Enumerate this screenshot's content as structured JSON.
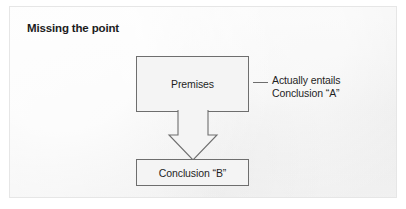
{
  "panel": {
    "background_color": "#f2f2f2",
    "border_color": "#e6e6e6"
  },
  "title": "Missing the point",
  "diagram": {
    "type": "flow-diagram",
    "stroke_color": "#6e6e6e",
    "text_color": "#1f1f1f",
    "nodes": [
      {
        "id": "premises",
        "label": "Premises"
      },
      {
        "id": "conclusion_b",
        "label": "Conclusion “B”"
      }
    ],
    "edges": [
      {
        "from": "premises",
        "to": "conclusion_b",
        "style": "hollow-block-arrow",
        "direction": "down"
      }
    ],
    "annotation": {
      "target": "premises",
      "leader": "short-horizontal-line",
      "lines": [
        "Actually entails",
        "Conclusion “A”"
      ]
    }
  }
}
